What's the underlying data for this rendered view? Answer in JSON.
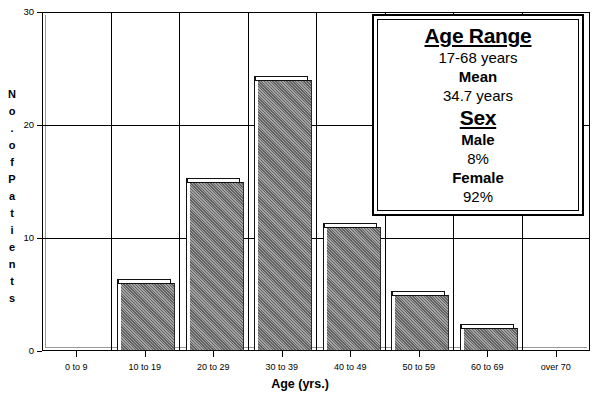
{
  "chart_data": {
    "type": "bar",
    "title": "",
    "xlabel": "Age (yrs.)",
    "ylabel": "No. of Patients",
    "categories": [
      "0 to 9",
      "10 to 19",
      "20 to 29",
      "30 to 39",
      "40 to 49",
      "50 to 59",
      "60 to 69",
      "over 70"
    ],
    "values": [
      0,
      6,
      15,
      24,
      11,
      5,
      2,
      0
    ],
    "ylim": [
      0,
      30
    ],
    "yticks": [
      0,
      10,
      20,
      30
    ],
    "ytick_labels": [
      "0",
      "10",
      "20",
      "30"
    ],
    "grid": "horizontal-and-vertical",
    "legend": "none",
    "bar_color": "#8a8a8a",
    "axis_color": "#000000"
  },
  "y_axis": {
    "title_letters": [
      "N",
      "o",
      ".",
      "o",
      "f",
      "P",
      "a",
      "t",
      "i",
      "e",
      "n",
      "t",
      "s"
    ]
  },
  "info_box": {
    "age_heading": "Age Range",
    "age_range": "17-68 years",
    "mean_label": "Mean",
    "mean_value": "34.7 years",
    "sex_heading": "Sex",
    "male_label": "Male",
    "male_value": "8%",
    "female_label": "Female",
    "female_value": "92%"
  }
}
